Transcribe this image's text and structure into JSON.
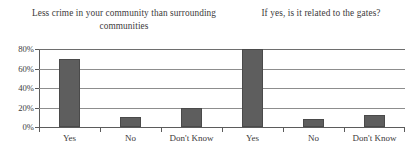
{
  "chart_data": {
    "type": "bar",
    "title": "",
    "titles": [
      "Less crime in your community than surrounding communities",
      "If yes, is it related to the gates?"
    ],
    "panels": [
      {
        "title": "Less crime in your community than surrounding communities",
        "categories": [
          "Yes",
          "No",
          "Don't Know"
        ],
        "values": [
          70,
          10,
          20
        ]
      },
      {
        "title": "If yes, is it related to the gates?",
        "categories": [
          "Yes",
          "No",
          "Don't Know"
        ],
        "values": [
          80,
          8,
          12
        ]
      }
    ],
    "categories": [
      "Yes",
      "No",
      "Don't Know",
      "Yes",
      "No",
      "Don't Know"
    ],
    "values": [
      70,
      10,
      20,
      80,
      8,
      12
    ],
    "xlabel": "",
    "ylabel": "",
    "ylim": [
      0,
      80
    ],
    "yticks": [
      0,
      20,
      40,
      60,
      80
    ],
    "ytick_labels": [
      "0%",
      "20%",
      "40%",
      "60%",
      "80%"
    ],
    "grid": true,
    "legend": false,
    "bar_color": "#5e5e5e",
    "bar_edge_color": "#4a4a4a",
    "axis_color": "#5b5b5b",
    "grid_color": "#8d8d8d",
    "text_color": "#3c3a3a"
  },
  "bars": [
    {
      "label": "Yes",
      "value": 70,
      "value_label": "70%",
      "panel": 0
    },
    {
      "label": "No",
      "value": 10,
      "value_label": "10%",
      "panel": 0
    },
    {
      "label": "Don't Know",
      "value": 20,
      "value_label": "20%",
      "panel": 0
    },
    {
      "label": "Yes",
      "value": 80,
      "value_label": "80%",
      "panel": 1
    },
    {
      "label": "No",
      "value": 8,
      "value_label": "8%",
      "panel": 1
    },
    {
      "label": "Don't Know",
      "value": 12,
      "value_label": "12%",
      "panel": 1
    }
  ],
  "yaxis": {
    "ticks": [
      {
        "label": "80%",
        "value": 80
      },
      {
        "label": "60%",
        "value": 60
      },
      {
        "label": "40%",
        "value": 40
      },
      {
        "label": "20%",
        "value": 20
      },
      {
        "label": "0%",
        "value": 0
      }
    ]
  }
}
